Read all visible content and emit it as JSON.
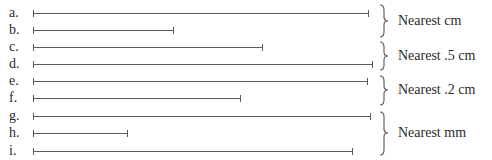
{
  "segments": [
    {
      "label": "a.",
      "start_x": 33,
      "end_x": 369,
      "y": 13
    },
    {
      "label": "b.",
      "start_x": 33,
      "end_x": 174,
      "y": 30
    },
    {
      "label": "c.",
      "start_x": 33,
      "end_x": 263,
      "y": 47
    },
    {
      "label": "d.",
      "start_x": 33,
      "end_x": 373,
      "y": 64
    },
    {
      "label": "e.",
      "start_x": 33,
      "end_x": 368,
      "y": 81
    },
    {
      "label": "f.",
      "start_x": 33,
      "end_x": 241,
      "y": 98
    },
    {
      "label": "g.",
      "start_x": 33,
      "end_x": 371,
      "y": 116
    },
    {
      "label": "h.",
      "start_x": 33,
      "end_x": 128,
      "y": 133
    },
    {
      "label": "i.",
      "start_x": 33,
      "end_x": 353,
      "y": 151
    }
  ],
  "groups": [
    {
      "label": "Nearest cm",
      "top": 5,
      "bottom": 37,
      "label_y": 14
    },
    {
      "label": "Nearest .5 cm",
      "top": 42,
      "bottom": 70,
      "label_y": 49
    },
    {
      "label": "Nearest .2 cm",
      "top": 76,
      "bottom": 105,
      "label_y": 83
    },
    {
      "label": "Nearest mm",
      "top": 112,
      "bottom": 155,
      "label_y": 126
    }
  ]
}
